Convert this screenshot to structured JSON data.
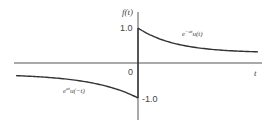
{
  "chart_data": {
    "type": "line",
    "title": "",
    "xlabel": "t",
    "ylabel": "f(t)",
    "ylim": [
      -1.0,
      1.0
    ],
    "yticks": [
      {
        "value": 1.0,
        "label": "1.0"
      },
      {
        "value": -1.0,
        "label": "-1.0"
      }
    ],
    "origin_label": "0",
    "grid": false,
    "series": [
      {
        "name": "e^{-at}u(t)",
        "label_base": "e",
        "label_exp": "−at",
        "label_rest": "u(t)",
        "domain": "t>0",
        "start_value": 1.0,
        "asymptote": 0.29,
        "decay": 3.2
      },
      {
        "name": "e^{at}u(-t)",
        "label_base": "e",
        "label_exp": "at",
        "label_rest": "u(−t)",
        "domain": "t<0",
        "start_value": -1.0,
        "asymptote": -0.31,
        "decay": 2.6
      }
    ]
  }
}
